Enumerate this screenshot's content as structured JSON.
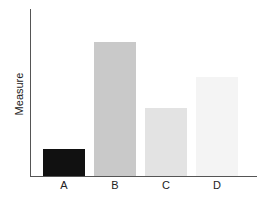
{
  "chart_data": {
    "type": "bar",
    "title": "",
    "xlabel": "",
    "ylabel": "Measure",
    "categories": [
      "A",
      "B",
      "C",
      "D"
    ],
    "values": [
      16,
      80,
      41,
      59
    ],
    "colors": [
      "#111111",
      "#c9c9c9",
      "#e3e3e3",
      "#f4f4f4"
    ],
    "ylim": [
      0,
      100
    ],
    "grid": false,
    "legend": "none",
    "y_ticks": "none"
  },
  "labels": {
    "ylabel": "Measure",
    "cat_0": "A",
    "cat_1": "B",
    "cat_2": "C",
    "cat_3": "D"
  }
}
